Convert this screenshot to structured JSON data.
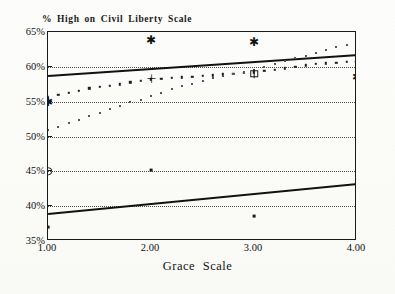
{
  "chart_data": {
    "type": "scatter",
    "title": "% High on Civil Liberty Scale",
    "xlabel": "Grace Scale",
    "ylabel": "",
    "xlim": [
      1.0,
      4.0
    ],
    "ylim": [
      35,
      65
    ],
    "grid": true,
    "legend": "none",
    "x_ticks": [
      "1.00",
      "2.00",
      "3.00",
      "4.00"
    ],
    "x_tick_values": [
      1.0,
      2.0,
      3.0,
      4.0
    ],
    "y_ticks": [
      "35%",
      "40%",
      "45%",
      "50%",
      "55%",
      "60%",
      "65%"
    ],
    "y_tick_values": [
      35,
      40,
      45,
      50,
      55,
      60,
      65
    ],
    "series": [
      {
        "name": "upper-regression-line",
        "type": "line",
        "style": "solid-thick",
        "x": [
          1.0,
          4.0
        ],
        "values": [
          58.8,
          61.8
        ]
      },
      {
        "name": "lower-regression-line",
        "type": "line",
        "style": "solid-thick",
        "x": [
          1.0,
          4.0
        ],
        "values": [
          39.0,
          43.3
        ]
      },
      {
        "name": "upper-dotted-series",
        "type": "scatter",
        "style": "dark-dots",
        "x": [
          1.0,
          1.1,
          1.2,
          1.3,
          1.4,
          1.5,
          1.6,
          1.7,
          1.8,
          1.9,
          2.0,
          2.1,
          2.2,
          2.3,
          2.4,
          2.5,
          2.6,
          2.7,
          2.8,
          2.9,
          3.0,
          3.1,
          3.2,
          3.3,
          3.4,
          3.5,
          3.6,
          3.7,
          3.8,
          3.9,
          4.0
        ],
        "values": [
          55.6,
          56.0,
          56.3,
          56.6,
          56.9,
          57.1,
          57.3,
          57.5,
          57.8,
          58.0,
          58.2,
          58.3,
          58.4,
          58.5,
          58.6,
          58.7,
          58.8,
          58.9,
          59.0,
          59.1,
          59.2,
          59.4,
          59.6,
          59.8,
          60.0,
          60.2,
          60.4,
          60.5,
          60.6,
          60.7,
          60.8
        ]
      },
      {
        "name": "lower-dotted-series",
        "type": "scatter",
        "style": "light-dots",
        "x": [
          1.0,
          1.1,
          1.2,
          1.3,
          1.4,
          1.5,
          1.6,
          1.7,
          1.8,
          1.9,
          2.0,
          2.1,
          2.2,
          2.3,
          2.4,
          2.5,
          2.6,
          2.7,
          2.8,
          2.9,
          3.0,
          3.1,
          3.2,
          3.3,
          3.4,
          3.5,
          3.6,
          3.7,
          3.8,
          3.9,
          4.0
        ],
        "values": [
          51.0,
          51.4,
          51.9,
          52.4,
          52.9,
          53.4,
          53.9,
          54.4,
          54.9,
          55.3,
          55.8,
          56.3,
          56.8,
          57.2,
          57.6,
          58.0,
          58.4,
          58.7,
          59.0,
          59.3,
          59.6,
          60.0,
          60.4,
          60.8,
          61.2,
          61.6,
          62.0,
          62.4,
          62.8,
          63.2,
          63.6
        ]
      },
      {
        "name": "special-markers",
        "type": "scatter",
        "style": "symbols",
        "points": [
          {
            "x": 1.0,
            "y": 55.0,
            "symbol": "asterisk"
          },
          {
            "x": 1.0,
            "y": 45.0,
            "symbol": "circle"
          },
          {
            "x": 1.0,
            "y": 37.0,
            "symbol": "dot"
          },
          {
            "x": 2.0,
            "y": 63.8,
            "symbol": "asterisk"
          },
          {
            "x": 2.0,
            "y": 58.2,
            "symbol": "plus"
          },
          {
            "x": 2.0,
            "y": 45.2,
            "symbol": "dot"
          },
          {
            "x": 3.0,
            "y": 63.5,
            "symbol": "asterisk"
          },
          {
            "x": 3.0,
            "y": 59.0,
            "symbol": "squareplus"
          },
          {
            "x": 3.0,
            "y": 38.6,
            "symbol": "dot"
          },
          {
            "x": 4.0,
            "y": 60.7,
            "symbol": "bigdot"
          },
          {
            "x": 4.0,
            "y": 58.5,
            "symbol": "asterisk"
          },
          {
            "x": 4.0,
            "y": 43.5,
            "symbol": "dot"
          }
        ]
      }
    ]
  },
  "colors": {
    "ink": "#1a1a1a",
    "grid": "#4a4a4a",
    "paper": "#fdfdfb"
  }
}
